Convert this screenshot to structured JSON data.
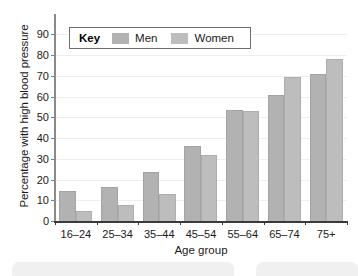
{
  "chart_data": {
    "type": "bar",
    "title": "",
    "xlabel": "Age group",
    "ylabel": "Percentage with high blood pressure",
    "categories": [
      "16–24",
      "25–34",
      "35–44",
      "45–54",
      "55–64",
      "65–74",
      "75+"
    ],
    "series": [
      {
        "name": "Men",
        "color": "#b2b2b2",
        "values": [
          14.5,
          16.5,
          23.5,
          36,
          53.5,
          61,
          71
        ]
      },
      {
        "name": "Women",
        "color": "#bdbdbd",
        "values": [
          5,
          7.5,
          13,
          32,
          53,
          69.5,
          78
        ]
      }
    ],
    "ylim": [
      0,
      95
    ],
    "yticks": [
      0,
      10,
      20,
      30,
      40,
      50,
      60,
      70,
      80,
      90
    ],
    "ytick_labels": [
      "0",
      "10",
      "20",
      "30",
      "40",
      "50",
      "60",
      "70",
      "80",
      "90"
    ],
    "grid": true,
    "legend_position": "upper-left-inside"
  },
  "legend": {
    "key_label": "Key",
    "entries": [
      {
        "label": "Men",
        "color": "#b2b2b2"
      },
      {
        "label": "Women",
        "color": "#bdbdbd"
      }
    ]
  }
}
